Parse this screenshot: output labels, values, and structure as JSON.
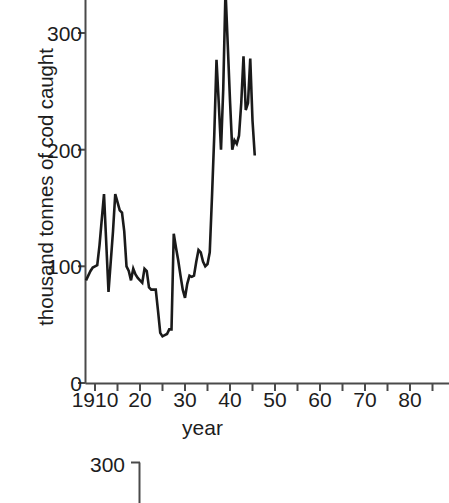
{
  "chart_data": [
    {
      "type": "line",
      "title": "",
      "xlabel": "year",
      "ylabel": "thousand tonnes of cod caught",
      "xlim": [
        1905.5,
        1986.0
      ],
      "ylim": [
        0,
        337
      ],
      "grid": false,
      "legend": "none",
      "xtick_labels": [
        "1910",
        "20",
        "30",
        "40",
        "50",
        "60",
        "70",
        "80"
      ],
      "xtick_values": [
        1910,
        1920,
        1930,
        1940,
        1950,
        1960,
        1970,
        1980
      ],
      "ytick_labels": [
        "0",
        "100",
        "200",
        "300"
      ],
      "ytick_values": [
        0,
        100,
        200,
        300
      ],
      "note": "plot region cropped at top and right edges of the screenshot",
      "x": [
        1906,
        1907,
        1908,
        1909,
        1910,
        1911,
        1912,
        1913,
        1914,
        1915,
        1916,
        1917,
        1918,
        1919,
        1920,
        1921,
        1922,
        1923,
        1924,
        1925,
        1926,
        1927,
        1928,
        1929,
        1930,
        1931,
        1932,
        1933,
        1934,
        1935,
        1936,
        1937,
        1938,
        1939,
        1940,
        1941,
        1942,
        1943,
        1944,
        1945,
        1946,
        1947,
        1948,
        1949,
        1950,
        1951,
        1952,
        1953,
        1954,
        1955,
        1956,
        1957,
        1958,
        1959,
        1960,
        1961,
        1962,
        1963,
        1964,
        1965,
        1966,
        1967,
        1968,
        1969,
        1970,
        1971,
        1972,
        1973,
        1974,
        1975,
        1976,
        1977,
        1978,
        1979,
        1980,
        1981,
        1982,
        1983,
        1984,
        1985
      ],
      "y": [
        88,
        92,
        96,
        99,
        100,
        101,
        118,
        140,
        162,
        120,
        78,
        104,
        130,
        162,
        155,
        148,
        146,
        130,
        100,
        96,
        88,
        98,
        93,
        90,
        88,
        86,
        98,
        96,
        82,
        80,
        80,
        80,
        62,
        43,
        40,
        41,
        42,
        46,
        46,
        128,
        116,
        105,
        92,
        80,
        73,
        85,
        92,
        91,
        92,
        104,
        114,
        112,
        104,
        100,
        102,
        112,
        160,
        212,
        277,
        240,
        200,
        252,
        337,
        290,
        242,
        200,
        208,
        205,
        212,
        240,
        280,
        234,
        240,
        278,
        225,
        195
      ]
    },
    {
      "type": "line",
      "title": "",
      "ytick_labels": [
        "300"
      ],
      "ytick_values": [
        300
      ],
      "note": "second figure, only the top-left axis corner and the 300 label are visible at the bottom edge"
    }
  ],
  "axes": {
    "y_title": "thousand tonnes of cod caught",
    "x_title": "year",
    "y_ticks": [
      "300",
      "200",
      "100",
      "0"
    ],
    "x_ticks": [
      "1910",
      "20",
      "30",
      "40",
      "50",
      "60",
      "70",
      "80"
    ]
  },
  "figure2": {
    "y_tick": "300"
  },
  "colors": {
    "line": "#1a1a1a",
    "axis": "#4a4a4a",
    "text": "#1d1d1d",
    "background": "#ffffff"
  }
}
